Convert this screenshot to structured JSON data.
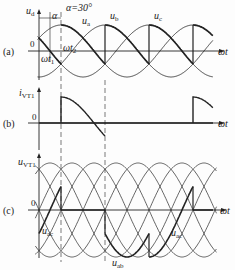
{
  "panels": {
    "a": {
      "tag": "(a)",
      "ylabel": "u",
      "ylabel_sub": "d",
      "origin": "0",
      "xlabel": "ωt",
      "alpha_label": "α",
      "alpha_value": "α=30°",
      "wt1": "ωt",
      "wt1_sub": "1",
      "wt2": "ωt",
      "wt2_sub": "2",
      "phase_labels": [
        {
          "t": "u",
          "s": "a"
        },
        {
          "t": "u",
          "s": "b"
        },
        {
          "t": "u",
          "s": "c"
        }
      ]
    },
    "b": {
      "tag": "(b)",
      "ylabel": "i",
      "ylabel_sub": "VT1",
      "origin": "0",
      "xlabel": "ωt"
    },
    "c": {
      "tag": "(c)",
      "ylabel": "u",
      "ylabel_sub": "VT1",
      "origin": "0",
      "xlabel": "ωt",
      "curve_labels": [
        {
          "t": "u",
          "s": "ac"
        },
        {
          "t": "u",
          "s": "ab"
        },
        {
          "t": "u",
          "s": "ac"
        }
      ]
    }
  },
  "chart_data": {
    "type": "line",
    "alpha_deg": 30,
    "series": [
      {
        "name": "u_a",
        "panel": "a",
        "phase_deg": 0
      },
      {
        "name": "u_b",
        "panel": "a",
        "phase_deg": -120
      },
      {
        "name": "u_c",
        "panel": "a",
        "phase_deg": 120
      },
      {
        "name": "u_d",
        "panel": "a",
        "note": "bold envelope, conduction 60°-180°, 180°-300°, ..."
      },
      {
        "name": "i_VT1",
        "panel": "b",
        "note": "conducts 60° to 180°, repeats every 360°"
      },
      {
        "name": "u_VT1",
        "panel": "c",
        "note": "line voltages u_ab, u_ac with bold device voltage"
      }
    ],
    "xlabel": "ωt"
  }
}
